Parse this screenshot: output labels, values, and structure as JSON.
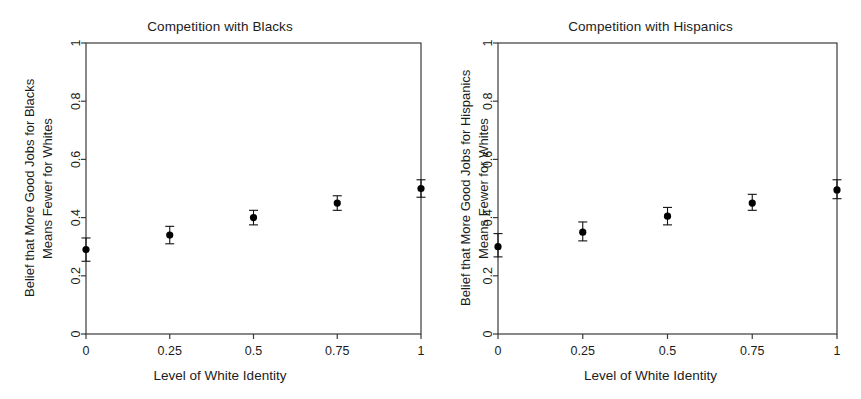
{
  "figure": {
    "background": "#ffffff",
    "foreground": "#1c1c1c",
    "point_color": "#000000"
  },
  "panels": [
    {
      "id": "blacks",
      "title": "Competition with Blacks",
      "xlabel": "Level of White Identity",
      "ylabel_line1": "Belief that More Good Jobs for Blacks",
      "ylabel_line2": "Means Fewer for Whites",
      "xticks": [
        "0",
        "0.25",
        "0.5",
        "0.75",
        "1"
      ],
      "yticks": [
        "0",
        "0.2",
        "0.4",
        "0.6",
        "0.8",
        "1"
      ]
    },
    {
      "id": "hispanics",
      "title": "Competition with Hispanics",
      "xlabel": "Level of White Identity",
      "ylabel_line1": "Belief that More Good Jobs for Hispanics",
      "ylabel_line2": "Means Fewer for Whites",
      "xticks": [
        "0",
        "0.25",
        "0.5",
        "0.75",
        "1"
      ],
      "yticks": [
        "0",
        "0.2",
        "0.4",
        "0.6",
        "0.8",
        "1"
      ]
    }
  ],
  "chart_data": [
    {
      "type": "scatter",
      "panel": "Competition with Blacks",
      "title": "Competition with Blacks",
      "xlabel": "Level of White Identity",
      "ylabel": "Belief that More Good Jobs for Blacks Means Fewer for Whites",
      "xlim": [
        0,
        1
      ],
      "ylim": [
        0,
        1
      ],
      "xticks": [
        0,
        0.25,
        0.5,
        0.75,
        1
      ],
      "yticks": [
        0,
        0.2,
        0.4,
        0.6,
        0.8,
        1
      ],
      "grid": false,
      "legend": "none",
      "x": [
        0,
        0.25,
        0.5,
        0.75,
        1
      ],
      "values": [
        0.29,
        0.34,
        0.4,
        0.45,
        0.5
      ],
      "error_low": [
        0.25,
        0.31,
        0.375,
        0.425,
        0.47
      ],
      "error_high": [
        0.33,
        0.37,
        0.425,
        0.475,
        0.53
      ],
      "error_bars": true,
      "marker": "filled-circle"
    },
    {
      "type": "scatter",
      "panel": "Competition with Hispanics",
      "title": "Competition with Hispanics",
      "xlabel": "Level of White Identity",
      "ylabel": "Belief that More Good Jobs for Hispanics Means Fewer for Whites",
      "xlim": [
        0,
        1
      ],
      "ylim": [
        0,
        1
      ],
      "xticks": [
        0,
        0.25,
        0.5,
        0.75,
        1
      ],
      "yticks": [
        0,
        0.2,
        0.4,
        0.6,
        0.8,
        1
      ],
      "grid": false,
      "legend": "none",
      "x": [
        0,
        0.25,
        0.5,
        0.75,
        1
      ],
      "values": [
        0.3,
        0.35,
        0.405,
        0.45,
        0.495
      ],
      "error_low": [
        0.265,
        0.32,
        0.375,
        0.425,
        0.465
      ],
      "error_high": [
        0.345,
        0.385,
        0.435,
        0.48,
        0.53
      ],
      "error_bars": true,
      "marker": "filled-circle"
    }
  ]
}
